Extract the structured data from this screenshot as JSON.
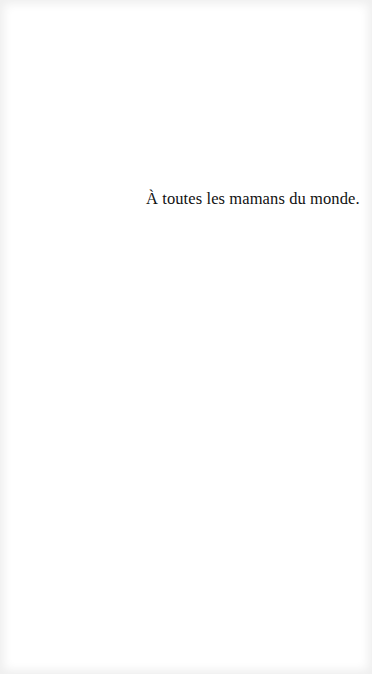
{
  "page": {
    "dedication": "À toutes les mamans du monde."
  }
}
